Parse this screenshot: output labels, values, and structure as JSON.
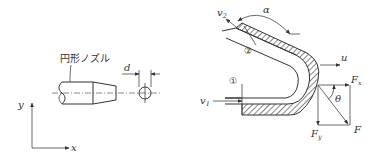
{
  "left_figure": {
    "nozzle_label": "円形ノズル",
    "diameter_label": "d",
    "axes": {
      "y_label": "y",
      "x_label": "x"
    }
  },
  "right_figure": {
    "inlet_section_label": "①",
    "outlet_section_label": "②",
    "inlet_velocity_label": "v",
    "inlet_velocity_sub": "1",
    "outlet_velocity_label": "v",
    "outlet_velocity_sub": "2",
    "angle_alpha_label": "α",
    "pipe_velocity_label": "u",
    "force_x_label": "F",
    "force_x_sub": "x",
    "force_y_label": "F",
    "force_y_sub": "y",
    "force_label": "F",
    "angle_theta_label": "θ"
  },
  "colors": {
    "ink": "#333333",
    "background": "#ffffff"
  }
}
